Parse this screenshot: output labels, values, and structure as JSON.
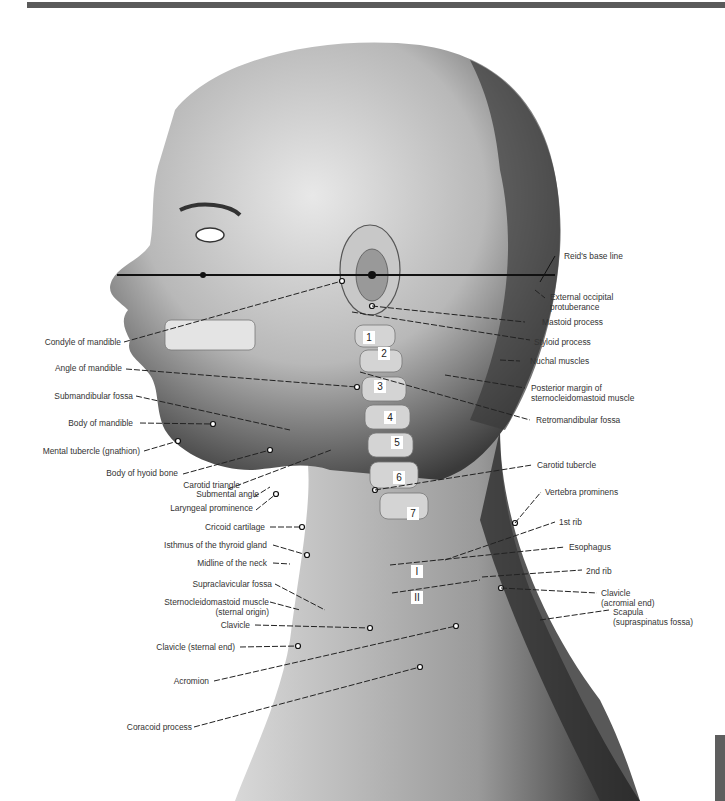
{
  "figure": {
    "left_labels": [
      {
        "id": "condyle",
        "text": "Condyle of mandible"
      },
      {
        "id": "angle",
        "text": "Angle of mandible"
      },
      {
        "id": "submandibular",
        "text": "Submandibular fossa"
      },
      {
        "id": "body_mandible",
        "text": "Body of mandible"
      },
      {
        "id": "mental",
        "text": "Mental tubercle (gnathion)"
      },
      {
        "id": "hyoid",
        "text": "Body of hyoid bone"
      },
      {
        "id": "carotid_triangle",
        "text": "Carotid triangle"
      },
      {
        "id": "submental",
        "text": "Submental angle"
      },
      {
        "id": "laryngeal",
        "text": "Laryngeal prominence"
      },
      {
        "id": "cricoid",
        "text": "Cricoid cartilage"
      },
      {
        "id": "isthmus",
        "text": "Isthmus of the thyroid gland"
      },
      {
        "id": "midline",
        "text": "Midline of the neck"
      },
      {
        "id": "supraclavicular",
        "text": "Supraclavicular fossa"
      },
      {
        "id": "scm_line1",
        "text": "Sternocleidomastoid muscle"
      },
      {
        "id": "scm_line2",
        "text": "(sternal origin)"
      },
      {
        "id": "clavicle",
        "text": "Clavicle"
      },
      {
        "id": "clavicle_sternal",
        "text": "Clavicle (sternal end)"
      },
      {
        "id": "acromion",
        "text": "Acromion"
      },
      {
        "id": "coracoid",
        "text": "Coracoid process"
      }
    ],
    "right_labels": [
      {
        "id": "reid",
        "text": "Reid's base line"
      },
      {
        "id": "eop_line1",
        "text": "External occipital"
      },
      {
        "id": "eop_line2",
        "text": "protuberance"
      },
      {
        "id": "mastoid",
        "text": "Mastoid process"
      },
      {
        "id": "styloid",
        "text": "Styloid process"
      },
      {
        "id": "nuchal",
        "text": "Nuchal muscles"
      },
      {
        "id": "post_margin_line1",
        "text": "Posterior margin of"
      },
      {
        "id": "post_margin_line2",
        "text": "sternocleidomastoid muscle"
      },
      {
        "id": "retromandibular",
        "text": "Retromandibular fossa"
      },
      {
        "id": "carotid_tubercle",
        "text": "Carotid tubercle"
      },
      {
        "id": "vertebra_prominens",
        "text": "Vertebra prominens"
      },
      {
        "id": "rib1",
        "text": "1st rib"
      },
      {
        "id": "esophagus",
        "text": "Esophagus"
      },
      {
        "id": "rib2",
        "text": "2nd rib"
      },
      {
        "id": "clav_acr_line1",
        "text": "Clavicle"
      },
      {
        "id": "clav_acr_line2",
        "text": "(acromial end)"
      },
      {
        "id": "scapula_line1",
        "text": "Scapula"
      },
      {
        "id": "scapula_line2",
        "text": "(supraspinatus fossa)"
      }
    ],
    "vertebra_numbers": [
      "1",
      "2",
      "3",
      "4",
      "5",
      "6",
      "7"
    ],
    "rib_numbers": [
      "I",
      "II"
    ]
  }
}
